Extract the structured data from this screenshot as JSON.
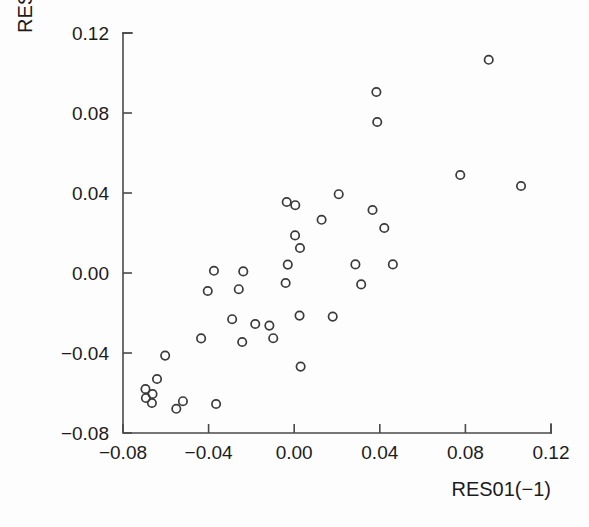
{
  "chart_data": {
    "type": "scatter",
    "title": "",
    "xlabel": "RES01(−1)",
    "ylabel": "RES01",
    "xlim": [
      -0.08,
      0.12
    ],
    "ylim": [
      -0.08,
      0.12
    ],
    "xticks": [
      -0.08,
      -0.04,
      0.0,
      0.04,
      0.08,
      0.12
    ],
    "yticks": [
      -0.08,
      -0.04,
      0.0,
      0.04,
      0.08,
      0.12
    ],
    "xtick_labels": [
      "−0.08",
      "−0.04",
      "0.00",
      "0.04",
      "0.08",
      "0.12"
    ],
    "ytick_labels": [
      "−0.08",
      "−0.04",
      "0.00",
      "0.04",
      "0.08",
      "0.12"
    ],
    "grid": false,
    "legend": null,
    "marker": "open-circle",
    "marker_color": "#3a3a3a",
    "n_points": 40,
    "points": [
      {
        "x": -0.0641,
        "y": -0.053
      },
      {
        "x": -0.0662,
        "y": -0.0605
      },
      {
        "x": -0.0665,
        "y": -0.065
      },
      {
        "x": -0.0693,
        "y": -0.0625
      },
      {
        "x": -0.0551,
        "y": -0.0679
      },
      {
        "x": -0.0603,
        "y": -0.0413
      },
      {
        "x": -0.052,
        "y": -0.0641
      },
      {
        "x": -0.0435,
        "y": -0.0327
      },
      {
        "x": -0.0365,
        "y": -0.0655
      },
      {
        "x": -0.0404,
        "y": -0.009
      },
      {
        "x": -0.0375,
        "y": 0.0011
      },
      {
        "x": -0.029,
        "y": -0.0231
      },
      {
        "x": -0.0259,
        "y": -0.0081
      },
      {
        "x": -0.0238,
        "y": 0.0008
      },
      {
        "x": -0.0243,
        "y": -0.0345
      },
      {
        "x": -0.0182,
        "y": -0.0255
      },
      {
        "x": -0.0116,
        "y": -0.0263
      },
      {
        "x": -0.0098,
        "y": -0.0326
      },
      {
        "x": -0.004,
        "y": -0.005
      },
      {
        "x": -0.0035,
        "y": 0.0355
      },
      {
        "x": -0.003,
        "y": 0.0042
      },
      {
        "x": 0.0004,
        "y": 0.0188
      },
      {
        "x": 0.0005,
        "y": 0.0339
      },
      {
        "x": 0.0027,
        "y": 0.0125
      },
      {
        "x": 0.0025,
        "y": -0.0213
      },
      {
        "x": 0.003,
        "y": -0.0468
      },
      {
        "x": 0.0128,
        "y": 0.0266
      },
      {
        "x": 0.018,
        "y": -0.0218
      },
      {
        "x": 0.0208,
        "y": 0.0394
      },
      {
        "x": 0.0286,
        "y": 0.0043
      },
      {
        "x": 0.0313,
        "y": -0.0057
      },
      {
        "x": 0.0366,
        "y": 0.0315
      },
      {
        "x": 0.0384,
        "y": 0.0905
      },
      {
        "x": 0.0388,
        "y": 0.0755
      },
      {
        "x": 0.0421,
        "y": 0.0225
      },
      {
        "x": 0.0461,
        "y": 0.0043
      },
      {
        "x": 0.0776,
        "y": 0.049
      },
      {
        "x": 0.0909,
        "y": 0.1066
      },
      {
        "x": 0.106,
        "y": 0.0435
      },
      {
        "x": -0.0695,
        "y": -0.058
      }
    ]
  },
  "figure": {
    "background_color": "#fdfdfd",
    "axis_color": "#4a4a4a",
    "text_color": "#1c1c1c"
  }
}
